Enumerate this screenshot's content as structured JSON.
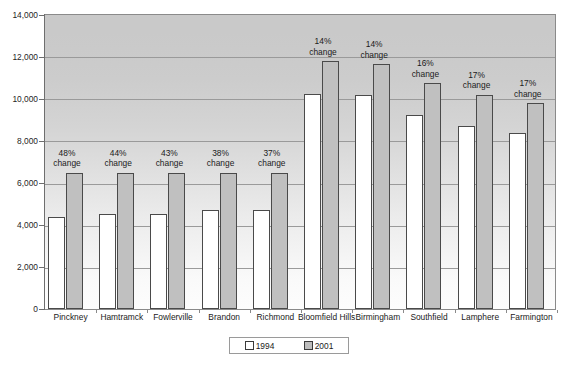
{
  "chart_data": {
    "type": "bar",
    "title": "",
    "xlabel": "",
    "ylabel": "",
    "ylim": [
      0,
      14000
    ],
    "ytick_step": 2000,
    "ytick_labels": [
      "14,000",
      "12,000",
      "10,000",
      "8,000",
      "6,000",
      "4,000",
      "2,000",
      "0"
    ],
    "ytick_values": [
      14000,
      12000,
      10000,
      8000,
      6000,
      4000,
      2000,
      0
    ],
    "grid": true,
    "legend_position": "bottom-center",
    "categories": [
      "Pinckney",
      "Hamtramck",
      "Fowlerville",
      "Brandon",
      "Richmond",
      "Bloomfield Hills",
      "Birmingham",
      "Southfield",
      "Lamphere",
      "Farmington"
    ],
    "series": [
      {
        "name": "1994",
        "color": "#ffffff",
        "values": [
          4400,
          4520,
          4530,
          4720,
          4720,
          10250,
          10200,
          9250,
          8720,
          8400
        ]
      },
      {
        "name": "2001",
        "color": "#c0c0c0",
        "values": [
          6500,
          6500,
          6500,
          6500,
          6500,
          11800,
          11650,
          10750,
          10200,
          9800
        ]
      }
    ],
    "annotations": [
      "48% change",
      "44% change",
      "43% change",
      "38% change",
      "37% change",
      "14% change",
      "14% change",
      "16% change",
      "17% change",
      "17% change"
    ],
    "annotation_percents": [
      "48%",
      "44%",
      "43%",
      "38%",
      "37%",
      "14%",
      "14%",
      "16%",
      "17%",
      "17%"
    ],
    "annotation_suffix": "change"
  },
  "legend": {
    "items": [
      {
        "label": "1994",
        "swatch": "white-square-swatch"
      },
      {
        "label": "2001",
        "swatch": "gray-square-swatch"
      }
    ]
  }
}
